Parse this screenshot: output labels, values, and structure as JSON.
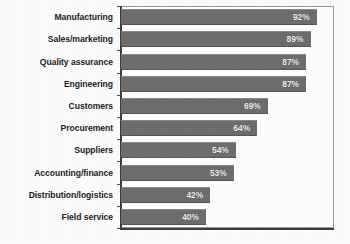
{
  "chart_data": {
    "type": "bar",
    "orientation": "horizontal",
    "title": "",
    "subtitle": "",
    "xlabel": "",
    "ylabel": "",
    "xlim": [
      0,
      100
    ],
    "grid": false,
    "legend": null,
    "value_suffix": "%",
    "categories": [
      "Manufacturing",
      "Sales/marketing",
      "Quality assurance",
      "Engineering",
      "Customers",
      "Procurement",
      "Suppliers",
      "Accounting/finance",
      "Distribution/logistics",
      "Field service"
    ],
    "values": [
      92,
      89,
      87,
      87,
      69,
      64,
      54,
      53,
      42,
      40
    ],
    "data_labels": [
      "92%",
      "89%",
      "87%",
      "87%",
      "69%",
      "64%",
      "54%",
      "53%",
      "42%",
      "40%"
    ],
    "bar_color": "#6e6e6e",
    "label_color": "#f2f2f2",
    "axis_color": "#3c3c3c",
    "frame_color": "#9a9a9a",
    "plot_background": "#ffffff"
  }
}
